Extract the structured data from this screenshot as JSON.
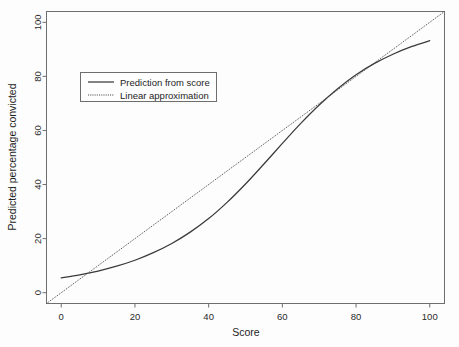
{
  "chart_data": {
    "type": "line",
    "title": "",
    "xlabel": "Score",
    "ylabel": "Predicted percentage convicted",
    "xlim": [
      -4,
      104
    ],
    "ylim": [
      -4,
      104
    ],
    "xticks": [
      0,
      20,
      40,
      60,
      80,
      100
    ],
    "yticks": [
      0,
      20,
      40,
      60,
      80,
      100
    ],
    "xtick_labels": [
      "0",
      "20",
      "40",
      "60",
      "80",
      "100"
    ],
    "ytick_labels": [
      "0",
      "20",
      "40",
      "60",
      "80",
      "100"
    ],
    "grid": false,
    "legend_position": "upper left",
    "series": [
      {
        "name": "Prediction from score",
        "style": "solid",
        "color": "#3a3a3a",
        "x": [
          0,
          5,
          10,
          15,
          20,
          25,
          30,
          35,
          40,
          45,
          50,
          55,
          60,
          65,
          70,
          75,
          80,
          85,
          90,
          95,
          100
        ],
        "y": [
          5.5,
          6.6,
          8.0,
          9.8,
          12.0,
          14.8,
          18.2,
          22.4,
          27.4,
          33.4,
          40.2,
          47.6,
          55.2,
          62.6,
          69.4,
          75.4,
          80.6,
          84.8,
          88.2,
          91.0,
          93.2
        ]
      },
      {
        "name": "Linear approximation",
        "style": "dotted",
        "color": "#4a4a4a",
        "x": [
          -4,
          104
        ],
        "y": [
          -4,
          104
        ]
      }
    ],
    "annotations": [
      {
        "label": "lower crossing",
        "x": 7,
        "y": 7.4
      },
      {
        "label": "upper crossing",
        "x": 88,
        "y": 87
      }
    ]
  },
  "legend": {
    "entries": [
      {
        "label": "Prediction from score"
      },
      {
        "label": "Linear approximation"
      }
    ]
  }
}
